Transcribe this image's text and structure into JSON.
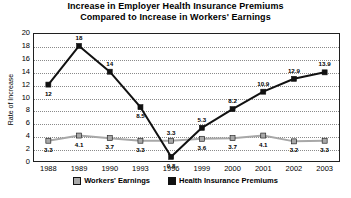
{
  "chart_data": {
    "type": "line",
    "title": "Increase in Employer Health Insurance Premiums Compared to Increase in Workers' Earnings",
    "title_line1": "Increase in Employer Health Insurance Premiums",
    "title_line2": "Compared to Increase in Workers' Earnings",
    "xlabel": "",
    "ylabel": "Rate of Increase",
    "ylim": [
      0,
      20
    ],
    "ytick_values": [
      0,
      2,
      4,
      6,
      8,
      10,
      12,
      14,
      16,
      18,
      20
    ],
    "ytick_labels": [
      "0",
      "2",
      "4",
      "6",
      "8",
      "10",
      "12",
      "14",
      "16",
      "18",
      "20"
    ],
    "grid": true,
    "grid_axis": "y",
    "legend_position": "bottom",
    "categories": [
      "1988",
      "1989",
      "1990",
      "1993",
      "1996",
      "1999",
      "2000",
      "2001",
      "2002",
      "2003"
    ],
    "series": [
      {
        "name": "Workers' Earnings",
        "color": "#a8a8a8",
        "marker": "square",
        "values": [
          3.3,
          4.1,
          3.7,
          3.3,
          3.3,
          3.6,
          3.7,
          4.1,
          3.2,
          3.3
        ],
        "labels": [
          "3.3",
          "4.1",
          "3.7",
          "3.3",
          "3.3",
          "3.6",
          "3.7",
          "4.1",
          "3.2",
          "3.3"
        ]
      },
      {
        "name": "Health Insurance Premiums",
        "color": "#111111",
        "marker": "square",
        "values": [
          12,
          18,
          14,
          8.5,
          0.8,
          5.3,
          8.2,
          10.9,
          12.9,
          13.9
        ],
        "labels": [
          "12",
          "18",
          "14",
          "8.5",
          "0.8",
          "5.3",
          "8.2",
          "10.9",
          "12.9",
          "13.9"
        ]
      }
    ]
  },
  "legend": {
    "items": [
      {
        "label": "Workers' Earnings",
        "swatch": "earnings"
      },
      {
        "label": "Health Insurance Premiums",
        "swatch": "premiums"
      }
    ]
  }
}
